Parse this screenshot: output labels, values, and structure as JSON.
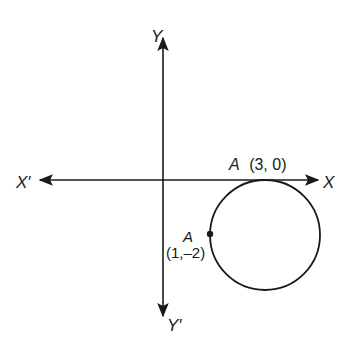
{
  "figure": {
    "axes": {
      "x_positive_label": "X",
      "x_negative_label": "X′",
      "y_positive_label": "Y",
      "y_negative_label": "Y′"
    },
    "points": [
      {
        "name": "A",
        "coords": "(3, 0)",
        "note": "point of tangency with X-axis"
      },
      {
        "name": "A",
        "coords": "(1,–2)",
        "note": "marked point on circle"
      }
    ],
    "circle": {
      "center_math": [
        3,
        -2
      ],
      "radius_math": 2
    },
    "colors": {
      "stroke": "#1a1a1a",
      "background": "#ffffff"
    }
  }
}
